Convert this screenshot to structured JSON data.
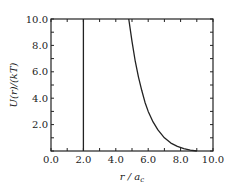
{
  "chart_data": {
    "type": "line",
    "title": "",
    "xlabel": "r / a_c",
    "xlabel_main": "r / a",
    "xlabel_sub": "c",
    "ylabel": "U(r)/(kT)",
    "xlim": [
      0.0,
      10.0
    ],
    "ylim": [
      0.0,
      10.0
    ],
    "grid": false,
    "legend": null,
    "x_ticks": [
      "0.0",
      "2.0",
      "4.0",
      "6.0",
      "8.0",
      "10.0"
    ],
    "y_ticks": [
      "2.0",
      "4.0",
      "6.0",
      "8.0",
      "10.0"
    ],
    "series": [
      {
        "name": "hard-core wall",
        "x": [
          2.0,
          2.0
        ],
        "y": [
          0.0,
          10.0
        ]
      },
      {
        "name": "repulsive potential",
        "x": [
          4.8,
          5.0,
          5.2,
          5.4,
          5.6,
          5.8,
          6.0,
          6.3,
          6.6,
          7.0,
          7.4,
          7.8,
          8.2,
          8.6,
          9.0
        ],
        "y": [
          10.0,
          8.3,
          6.8,
          5.6,
          4.6,
          3.7,
          3.0,
          2.2,
          1.6,
          1.0,
          0.6,
          0.35,
          0.18,
          0.07,
          0.0
        ]
      }
    ]
  }
}
